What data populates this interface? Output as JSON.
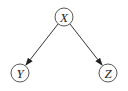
{
  "diagram": {
    "type": "directed-acyclic-graph",
    "nodes": [
      {
        "id": "X",
        "label": "X",
        "cx": 64,
        "cy": 17,
        "r": 9
      },
      {
        "id": "Y",
        "label": "Y",
        "cx": 20,
        "cy": 73,
        "r": 9
      },
      {
        "id": "Z",
        "label": "Z",
        "cx": 108,
        "cy": 73,
        "r": 9
      }
    ],
    "edges": [
      {
        "from": "X",
        "to": "Y"
      },
      {
        "from": "X",
        "to": "Z"
      }
    ],
    "colors": {
      "stroke": "#333333",
      "background": "#ffffff"
    }
  }
}
